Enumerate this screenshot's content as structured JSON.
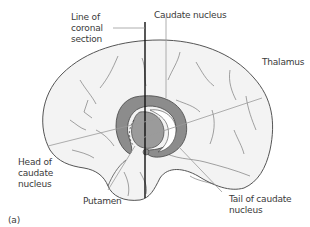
{
  "diagram": {
    "panel_label": "(a)",
    "labels": {
      "line_of_coronal_section": "Line of\ncoronal\nsection",
      "caudate_nucleus": "Caudate nucleus",
      "thalamus": "Thalamus",
      "head_of_caudate_nucleus": "Head of\ncaudate\nnucleus",
      "putamen": "Putamen",
      "tail_of_caudate_nucleus": "Tail of caudate\nnucleus"
    },
    "colors": {
      "brain_fill": "#f3f3f3",
      "brain_outline": "#555555",
      "structure_fill": "#8c8c8c",
      "inner_fill": "#a5a5a5",
      "leader_line": "#9a9a9a",
      "coronal_line": "#111111",
      "text": "#3a3a3a"
    }
  }
}
